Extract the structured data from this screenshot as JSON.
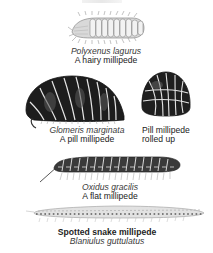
{
  "plate": {
    "background": "#ffffff",
    "ink_color": "#2a2a2a",
    "specimens": [
      {
        "id": "polyxenus",
        "illustration": "hairy-millipede-illustration",
        "scientific_name": "Polyxenus lagurus",
        "common_name": "A hairy millipede"
      },
      {
        "id": "glomeris",
        "illustration": "pill-millipede-illustration",
        "scientific_name": "Glomeris marginata",
        "common_name": "A pill millipede"
      },
      {
        "id": "glomeris-rolled",
        "illustration": "rolled-pill-millipede-illustration",
        "line1": "Pill millipede",
        "line2": "rolled up"
      },
      {
        "id": "oxidus",
        "illustration": "flat-millipede-illustration",
        "scientific_name": "Oxidus gracilis",
        "common_name": "A flat millipede"
      },
      {
        "id": "blaniulus",
        "illustration": "snake-millipede-illustration",
        "common_name": "Spotted snake millipede",
        "scientific_name": "Blaniulus guttulatus"
      }
    ]
  }
}
